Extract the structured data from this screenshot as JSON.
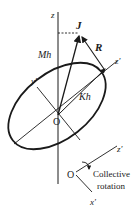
{
  "diagram": {
    "labels": {
      "z_axis": "z",
      "z_prime_axis": "z′",
      "y_prime_axis": "y′",
      "angular_momentum": "J",
      "resultant": "R",
      "mh": "Mh",
      "kh": "Kh",
      "origin": "O"
    },
    "inset": {
      "origin": "O",
      "z_prime": "z′",
      "x_prime": "x′",
      "caption_line1": "Collective",
      "caption_line2": "rotation"
    },
    "colors": {
      "stroke": "#1a1a1a",
      "background": "#ffffff"
    }
  }
}
